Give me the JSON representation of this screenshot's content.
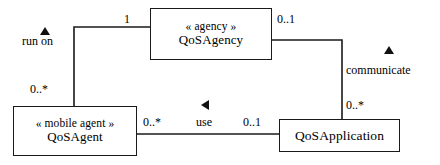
{
  "diagram": {
    "type": "uml-class-diagram",
    "line_color": "#1a1a1a",
    "background": "#ffffff"
  },
  "classes": [
    {
      "id": "qos-agency",
      "stereotype": "« agency »",
      "name": "QoSAgency"
    },
    {
      "id": "qos-agent",
      "stereotype": "« mobile agent »",
      "name": "QoSAgent"
    },
    {
      "id": "qos-application",
      "stereotype": "",
      "name": "QoSApplication"
    }
  ],
  "associations": [
    {
      "id": "run-on",
      "name": "run on",
      "direction_marker": "triangle-up",
      "source_multiplicity": "1",
      "target_multiplicity": "0..*"
    },
    {
      "id": "communicate",
      "name": "communicate",
      "direction_marker": "triangle-up",
      "source_multiplicity": "0..1",
      "target_multiplicity": "0..*"
    },
    {
      "id": "use",
      "name": "use",
      "direction_marker": "triangle-left",
      "source_multiplicity": "0..*",
      "target_multiplicity": "0..1"
    }
  ],
  "labels": {
    "run_on_name": "run on",
    "run_on_mult_top": "1",
    "run_on_mult_bottom": "0..*",
    "communicate_name": "communicate",
    "communicate_mult_top": "0..1",
    "communicate_mult_bottom": "0..*",
    "use_name": "use",
    "use_mult_left": "0..*",
    "use_mult_right": "0..1"
  }
}
